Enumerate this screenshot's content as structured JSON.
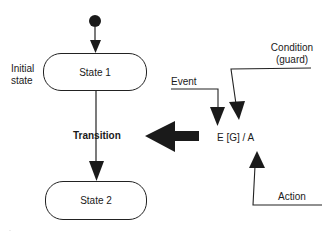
{
  "diagram": {
    "initial_state_label": [
      "Initial",
      "state"
    ],
    "states": [
      {
        "name": "State 1"
      },
      {
        "name": "State 2"
      }
    ],
    "transition_label": "Transition",
    "transition_expression": "E [G] / A",
    "annotations": {
      "event": "Event",
      "condition": [
        "Condition",
        "(guard)"
      ],
      "action": "Action"
    },
    "colors": {
      "stroke": "#222222",
      "fill": "#1a1a1a",
      "background": "#ffffff"
    }
  }
}
